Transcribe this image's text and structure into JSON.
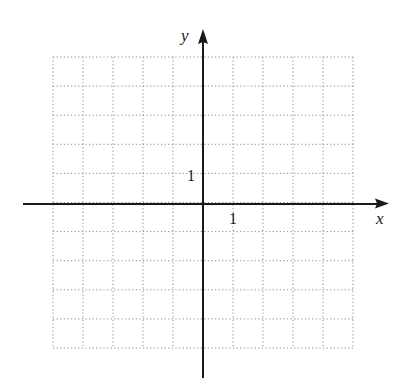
{
  "diagram": {
    "type": "coordinate-plane",
    "x_axis_label": "x",
    "y_axis_label": "y",
    "x_unit_label": "1",
    "y_unit_label": "1",
    "grid": {
      "columns": 10,
      "rows": 10,
      "x_range": [
        -5,
        5
      ],
      "y_range": [
        -5,
        5
      ],
      "style": "dotted"
    },
    "colors": {
      "axis": "#1a1a1a",
      "grid": "#8c8c8c",
      "background": "#ffffff"
    }
  },
  "chart_data": {
    "type": "scatter",
    "title": "",
    "xlabel": "x",
    "ylabel": "y",
    "xlim": [
      -5,
      5
    ],
    "ylim": [
      -5,
      5
    ],
    "grid": true,
    "x_tick_labels": [
      "1"
    ],
    "y_tick_labels": [
      "1"
    ],
    "series": []
  }
}
